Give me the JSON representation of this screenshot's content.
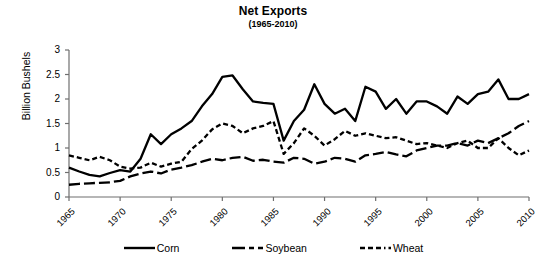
{
  "chart_data": {
    "type": "line",
    "title": "Net Exports",
    "subtitle": "(1965-2010)",
    "xlabel": "",
    "ylabel": "Billion Bushels",
    "ylim": [
      0,
      3
    ],
    "xlim": [
      1965,
      2010
    ],
    "grid": false,
    "legend_position": "bottom",
    "y_ticks": [
      "0",
      "0.5",
      "1",
      "1.5",
      "2",
      "2.5",
      "3"
    ],
    "y_tick_values": [
      0,
      0.5,
      1,
      1.5,
      2,
      2.5,
      3
    ],
    "x_ticks": [
      "1965",
      "1970",
      "1975",
      "1980",
      "1985",
      "1990",
      "1995",
      "2000",
      "2005",
      "2010"
    ],
    "x_tick_values": [
      1965,
      1970,
      1975,
      1980,
      1985,
      1990,
      1995,
      2000,
      2005,
      2010
    ],
    "x": [
      1965,
      1966,
      1967,
      1968,
      1969,
      1970,
      1971,
      1972,
      1973,
      1974,
      1975,
      1976,
      1977,
      1978,
      1979,
      1980,
      1981,
      1982,
      1983,
      1984,
      1985,
      1986,
      1987,
      1988,
      1989,
      1990,
      1991,
      1992,
      1993,
      1994,
      1995,
      1996,
      1997,
      1998,
      1999,
      2000,
      2001,
      2002,
      2003,
      2004,
      2005,
      2006,
      2007,
      2008,
      2009,
      2010
    ],
    "series": [
      {
        "name": "Corn",
        "style": "solid",
        "color": "#000000",
        "values": [
          0.6,
          0.52,
          0.45,
          0.42,
          0.49,
          0.55,
          0.52,
          0.78,
          1.28,
          1.08,
          1.28,
          1.4,
          1.55,
          1.85,
          2.1,
          2.45,
          2.48,
          2.2,
          1.95,
          1.92,
          1.9,
          1.15,
          1.55,
          1.78,
          2.3,
          1.9,
          1.7,
          1.8,
          1.55,
          2.25,
          2.15,
          1.8,
          2.0,
          1.7,
          1.95,
          1.95,
          1.85,
          1.7,
          2.05,
          1.9,
          2.1,
          2.15,
          2.4,
          2.0,
          2.0,
          2.1
        ],
        "min": 0.42,
        "max": 2.48
      },
      {
        "name": "Soybean",
        "style": "long-dash",
        "color": "#000000",
        "values": [
          0.25,
          0.27,
          0.28,
          0.29,
          0.3,
          0.33,
          0.42,
          0.48,
          0.52,
          0.48,
          0.56,
          0.6,
          0.65,
          0.72,
          0.78,
          0.75,
          0.8,
          0.82,
          0.74,
          0.76,
          0.72,
          0.7,
          0.8,
          0.78,
          0.68,
          0.72,
          0.8,
          0.78,
          0.72,
          0.85,
          0.88,
          0.92,
          0.87,
          0.83,
          0.95,
          1.0,
          1.05,
          1.05,
          1.1,
          1.05,
          1.15,
          1.1,
          1.2,
          1.3,
          1.45,
          1.55
        ],
        "min": 0.25,
        "max": 1.55
      },
      {
        "name": "Wheat",
        "style": "short-dash",
        "color": "#000000",
        "values": [
          0.85,
          0.8,
          0.75,
          0.82,
          0.75,
          0.62,
          0.58,
          0.6,
          0.7,
          0.62,
          0.68,
          0.72,
          0.98,
          1.15,
          1.38,
          1.5,
          1.45,
          1.3,
          1.4,
          1.45,
          1.55,
          0.88,
          1.1,
          1.4,
          1.25,
          1.05,
          1.18,
          1.35,
          1.25,
          1.3,
          1.25,
          1.2,
          1.22,
          1.15,
          1.08,
          1.1,
          1.05,
          1.0,
          1.1,
          1.15,
          1.0,
          1.0,
          1.2,
          1.0,
          0.85,
          0.95
        ],
        "min": 0.58,
        "max": 1.55
      }
    ]
  },
  "legend": {
    "items": [
      {
        "label": "Corn",
        "style": "solid"
      },
      {
        "label": "Soybean",
        "style": "long-dash"
      },
      {
        "label": "Wheat",
        "style": "short-dash"
      }
    ]
  }
}
